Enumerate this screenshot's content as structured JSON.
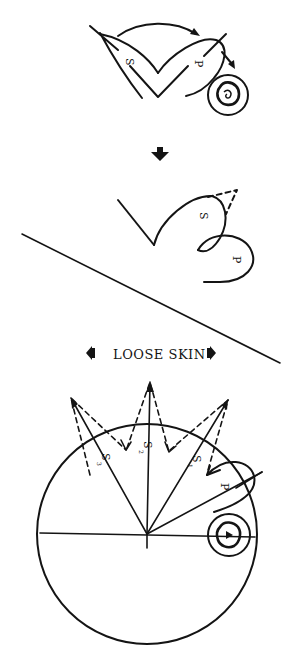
{
  "figure": {
    "panel_top": {
      "labels": {
        "s": "S",
        "p": "P"
      },
      "components": [
        "skin-flap-s",
        "skin-flap-p",
        "rotation-arrow",
        "defect-circle",
        "lesion"
      ]
    },
    "transition_arrow": {
      "direction": "down"
    },
    "panel_middle": {
      "labels": {
        "s": "S",
        "p": "P"
      },
      "components": [
        "flap-s-rotated",
        "flap-p-rotated",
        "dashed-outline",
        "divider-line"
      ]
    },
    "panel_bottom": {
      "caption": "LOOSE SKIN",
      "left_arrow": "arrow-left",
      "right_arrow": "arrow-right",
      "labels": {
        "s1": "S",
        "s1_sub": "1",
        "s2": "S",
        "s2_sub": "2",
        "s3": "S",
        "s3_sub": "3",
        "p": "P"
      },
      "components": [
        "circle",
        "radial-lines",
        "dashed-triangles",
        "flap-p",
        "defect-circle",
        "lesion",
        "horizontal-axis"
      ]
    }
  }
}
